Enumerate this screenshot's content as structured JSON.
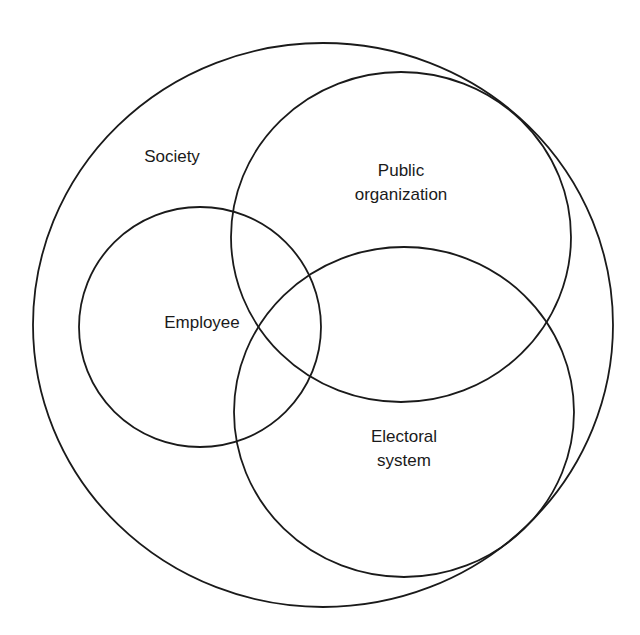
{
  "diagram": {
    "type": "venn",
    "sets": [
      {
        "id": "society",
        "label_lines": [
          "Society"
        ]
      },
      {
        "id": "public_organization",
        "label_lines": [
          "Public",
          "organization"
        ]
      },
      {
        "id": "employee",
        "label_lines": [
          "Employee"
        ]
      },
      {
        "id": "electoral_system",
        "label_lines": [
          "Electoral",
          "system"
        ]
      }
    ]
  },
  "labels": {
    "society": "Society",
    "public_organization_1": "Public",
    "public_organization_2": "organization",
    "employee": "Employee",
    "electoral_1": "Electoral",
    "electoral_2": "system"
  }
}
